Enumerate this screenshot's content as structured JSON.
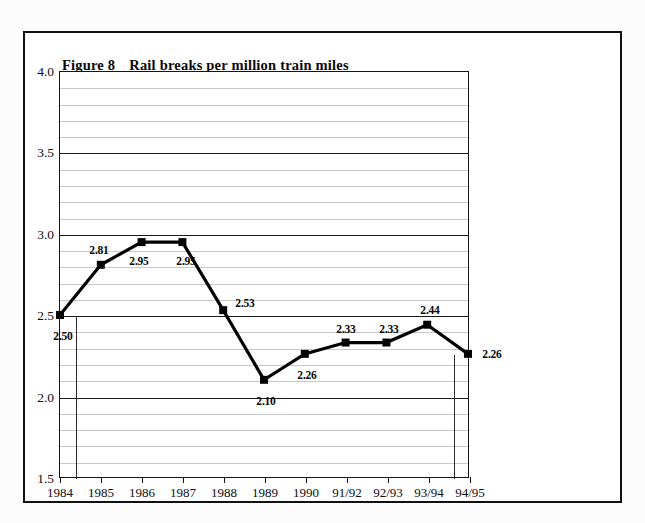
{
  "figure": {
    "number_label": "Figure 8",
    "title": "Rail breaks per million train miles"
  },
  "chart_data": {
    "type": "line",
    "title": "Rail breaks per million train miles",
    "xlabel": "",
    "ylabel": "",
    "categories": [
      "1984",
      "1985",
      "1986",
      "1987",
      "1988",
      "1989",
      "1990",
      "91/92",
      "92/93",
      "93/94",
      "94/95"
    ],
    "values": [
      2.5,
      2.81,
      2.95,
      2.95,
      2.53,
      2.1,
      2.26,
      2.33,
      2.33,
      2.44,
      2.26
    ],
    "point_labels": [
      "2.50",
      "2.81",
      "2.95",
      "2.95",
      "2.53",
      "2.10",
      "2.26",
      "2.33",
      "2.33",
      "2.44",
      "2.26"
    ],
    "ylim": [
      1.5,
      4.0
    ],
    "ytick_labels": [
      "4.0",
      "3.5",
      "3.0",
      "2.5",
      "2.0",
      "1.5"
    ],
    "ytick_values": [
      4.0,
      3.5,
      3.0,
      2.5,
      2.0,
      1.5
    ],
    "minor_tick_step": 0.1,
    "major_tick_step": 0.5,
    "grid": true,
    "legend": "none",
    "series_color": "#000000",
    "marker": "square",
    "gridline_minor_color": "#c9c9c9",
    "gridline_major_color": "#1a1a1a"
  }
}
